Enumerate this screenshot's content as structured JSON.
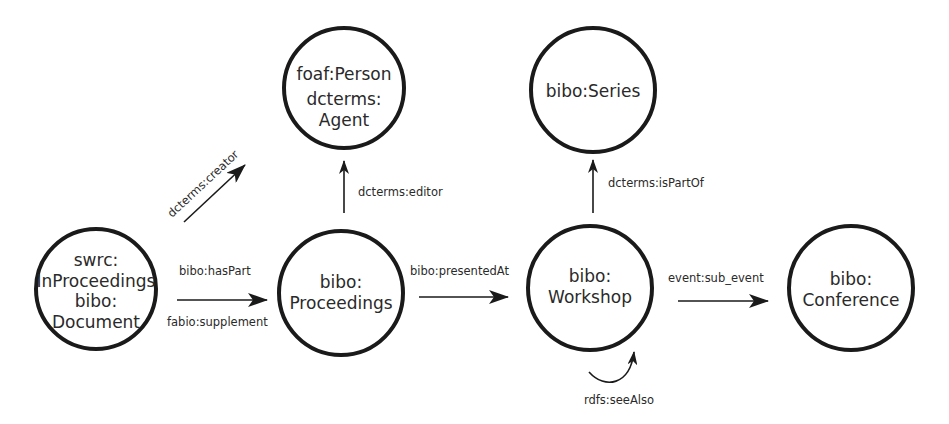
{
  "diagram": {
    "nodes": [
      {
        "id": "document",
        "lines": [
          "swrc:",
          "InProceedings",
          "bibo:",
          "Document"
        ]
      },
      {
        "id": "person",
        "lines": [
          "foaf:Person",
          "dcterms:",
          "Agent"
        ]
      },
      {
        "id": "proceedings",
        "lines": [
          "bibo:",
          "Proceedings"
        ]
      },
      {
        "id": "series",
        "lines": [
          "bibo:Series"
        ]
      },
      {
        "id": "workshop",
        "lines": [
          "bibo:",
          "Workshop"
        ]
      },
      {
        "id": "conference",
        "lines": [
          "bibo:",
          "Conference"
        ]
      }
    ],
    "edges": [
      {
        "id": "creator",
        "label": "dcterms:creator"
      },
      {
        "id": "editor",
        "label": "dcterms:editor"
      },
      {
        "id": "haspart",
        "label": "bibo:hasPart"
      },
      {
        "id": "supplement",
        "label": "fabio:supplement"
      },
      {
        "id": "presentedat",
        "label": "bibo:presentedAt"
      },
      {
        "id": "ispartof",
        "label": "dcterms:isPartOf"
      },
      {
        "id": "subevent",
        "label": "event:sub_event"
      },
      {
        "id": "seealso",
        "label": "rdfs:seeAlso"
      }
    ],
    "colors": {
      "stroke": "#1a1a1a",
      "text": "#2a2a2a",
      "background": "#ffffff"
    }
  }
}
